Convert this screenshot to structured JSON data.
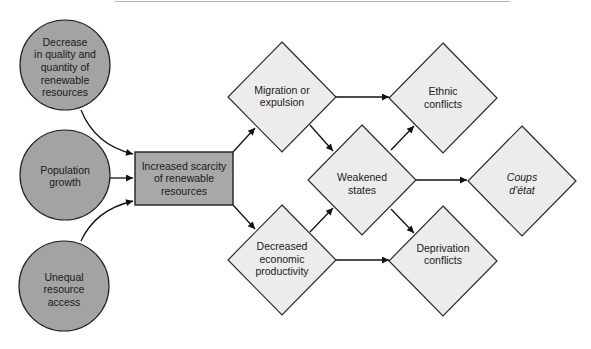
{
  "diagram": {
    "title": "",
    "colors": {
      "driver_fill": "#a3a3a3",
      "scarcity_fill": "#a8a8a8",
      "outcome_fill": "#ececec",
      "stroke": "#222222",
      "background": "#ffffff"
    },
    "nodes": {
      "decrease_quality": {
        "shape": "circle",
        "lines": [
          "Decrease",
          "in quality and",
          "quantity of",
          "renewable",
          "resources"
        ]
      },
      "population_growth": {
        "shape": "circle",
        "lines": [
          "Population",
          "growth"
        ]
      },
      "unequal_access": {
        "shape": "circle",
        "lines": [
          "Unequal",
          "resource",
          "access"
        ]
      },
      "increased_scarcity": {
        "shape": "rectangle",
        "lines": [
          "Increased scarcity",
          "of renewable",
          "resources"
        ]
      },
      "migration": {
        "shape": "diamond",
        "lines": [
          "Migration or",
          "expulsion"
        ]
      },
      "decreased_productivity": {
        "shape": "diamond",
        "lines": [
          "Decreased",
          "economic",
          "productivity"
        ]
      },
      "weakened_states": {
        "shape": "diamond",
        "lines": [
          "Weakened",
          "states"
        ]
      },
      "ethnic_conflicts": {
        "shape": "diamond",
        "lines": [
          "Ethnic",
          "conflicts"
        ]
      },
      "coups": {
        "shape": "diamond",
        "italic": true,
        "lines": [
          "Coups",
          "d'état"
        ]
      },
      "deprivation_conflicts": {
        "shape": "diamond",
        "lines": [
          "Deprivation",
          "conflicts"
        ]
      }
    },
    "edges": [
      {
        "from": "decrease_quality",
        "to": "increased_scarcity"
      },
      {
        "from": "population_growth",
        "to": "increased_scarcity"
      },
      {
        "from": "unequal_access",
        "to": "increased_scarcity"
      },
      {
        "from": "increased_scarcity",
        "to": "migration"
      },
      {
        "from": "increased_scarcity",
        "to": "decreased_productivity"
      },
      {
        "from": "migration",
        "to": "ethnic_conflicts"
      },
      {
        "from": "migration",
        "to": "weakened_states"
      },
      {
        "from": "decreased_productivity",
        "to": "weakened_states"
      },
      {
        "from": "decreased_productivity",
        "to": "deprivation_conflicts"
      },
      {
        "from": "weakened_states",
        "to": "ethnic_conflicts"
      },
      {
        "from": "weakened_states",
        "to": "coups"
      },
      {
        "from": "weakened_states",
        "to": "deprivation_conflicts"
      }
    ]
  }
}
